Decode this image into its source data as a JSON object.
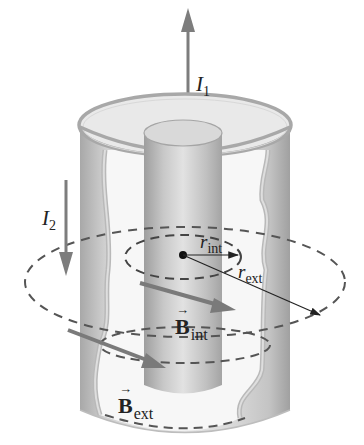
{
  "figure": {
    "colors": {
      "background": "#ffffff",
      "cylinder_light": "#e6e6e6",
      "cylinder_mid": "#bdbdbd",
      "cylinder_dark": "#9a9a9a",
      "arrow": "#7a7a7a",
      "dashed_loop": "#555555",
      "text": "#222222"
    }
  },
  "labels": {
    "i1": {
      "symbol": "I",
      "subscript": "1"
    },
    "i2": {
      "symbol": "I",
      "subscript": "2"
    },
    "r_int": {
      "symbol": "r",
      "subscript": "int"
    },
    "r_ext": {
      "symbol": "r",
      "subscript": "ext"
    },
    "b_int": {
      "symbol": "B",
      "vector_mark": "→",
      "subscript": "int"
    },
    "b_ext": {
      "symbol": "B",
      "vector_mark": "→",
      "subscript": "ext"
    }
  }
}
